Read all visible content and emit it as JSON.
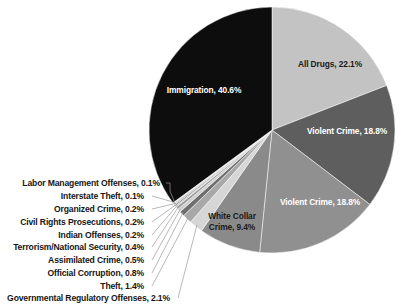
{
  "chart_data": {
    "type": "pie",
    "title": "",
    "subtitle": "",
    "legend_position": "none",
    "grid": false,
    "units": "percent",
    "total": 100.0,
    "start_angle_deg": 0,
    "direction": "clockwise",
    "categories": [
      "All Drugs",
      "Violent Crime",
      "Violent Crime",
      "White Collar Crime",
      "Governmental Regulatory Offenses",
      "Theft",
      "Official Corruption",
      "Assimilated Crime",
      "Terrorism/National Security",
      "Indian Offenses",
      "Civil Rights Prosecutions",
      "Organized Crime",
      "Interstate Theft",
      "Labor Management Offenses",
      "Immigration"
    ],
    "values": [
      22.1,
      18.8,
      18.8,
      9.4,
      2.1,
      1.4,
      0.8,
      0.5,
      0.4,
      0.2,
      0.2,
      0.2,
      0.1,
      0.1,
      40.6
    ],
    "colors": [
      "#c3c3c3",
      "#5e5e5e",
      "#909090",
      "#8a8a8a",
      "#d6d6d6",
      "#a8a8a8",
      "#6e6e6e",
      "#cfcfcf",
      "#9c9c9c",
      "#bdbdbd",
      "#737373",
      "#b5b5b5",
      "#8e8e8e",
      "#dcdcdc",
      "#0d0d0d"
    ],
    "slices": [
      {
        "label": "All Drugs, 22.1%",
        "name": "All Drugs",
        "value": 22.1,
        "text_color": "dark",
        "placement": "inside"
      },
      {
        "label": "Violent Crime, 18.8%",
        "name": "Violent Crime",
        "value": 18.8,
        "text_color": "light",
        "placement": "inside"
      },
      {
        "label": "Violent Crime, 18.8%",
        "name": "Violent Crime",
        "value": 18.8,
        "text_color": "light",
        "placement": "inside"
      },
      {
        "label": "White Collar",
        "name": "White Collar Crime",
        "value": 9.4,
        "text_color": "dark",
        "placement": "inside"
      },
      {
        "label": "Crime, 9.4%",
        "name": "White Collar Crime",
        "value": 9.4,
        "text_color": "dark",
        "placement": "inside"
      },
      {
        "label": "Immigration, 40.6%",
        "name": "Immigration",
        "value": 40.6,
        "text_color": "light",
        "placement": "inside"
      }
    ],
    "callouts": [
      {
        "label": "Labor Management Offenses, 0.1%",
        "name": "Labor Management Offenses",
        "value": 0.1
      },
      {
        "label": "Interstate Theft, 0.1%",
        "name": "Interstate Theft",
        "value": 0.1
      },
      {
        "label": "Organized Crime, 0.2%",
        "name": "Organized Crime",
        "value": 0.2
      },
      {
        "label": "Civil Rights Prosecutions, 0.2%",
        "name": "Civil Rights Prosecutions",
        "value": 0.2
      },
      {
        "label": "Indian Offenses, 0.2%",
        "name": "Indian Offenses",
        "value": 0.2
      },
      {
        "label": "Terrorism/National Security, 0.4%",
        "name": "Terrorism/National Security",
        "value": 0.4
      },
      {
        "label": "Assimilated Crime, 0.5%",
        "name": "Assimilated Crime",
        "value": 0.5
      },
      {
        "label": "Official Corruption, 0.8%",
        "name": "Official Corruption",
        "value": 0.8
      },
      {
        "label": "Theft, 1.4%",
        "name": "Theft",
        "value": 1.4
      },
      {
        "label": "Governmental Regulatory Offenses, 2.1%",
        "name": "Governmental Regulatory Offenses",
        "value": 2.1
      }
    ]
  }
}
